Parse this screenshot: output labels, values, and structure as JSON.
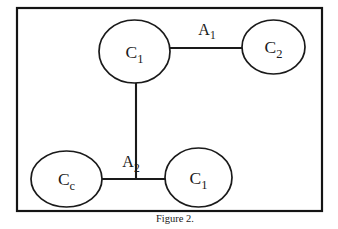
{
  "figure": {
    "caption": "Figure 2.",
    "frame": {
      "x": 17,
      "y": 8,
      "width": 305,
      "height": 203,
      "stroke_color": "#141414"
    },
    "background_color": "#ffffff",
    "ink_color": "#1a1a1a"
  },
  "diagram_data": {
    "type": "diagram",
    "title": "Figure 2.",
    "nodes": [
      {
        "id": "c1-top",
        "base": "C",
        "subscript": "1",
        "label": "C1",
        "cx": 134.5,
        "cy": 51.5,
        "rx": 35.5,
        "ry": 31.5
      },
      {
        "id": "c2-right",
        "base": "C",
        "subscript": "2",
        "label": "C2",
        "cx": 273.5,
        "cy": 47,
        "rx": 31.5,
        "ry": 27
      },
      {
        "id": "cc-bottomleft",
        "base": "C",
        "subscript": "c",
        "label": "Cc",
        "cx": 66.5,
        "cy": 179,
        "rx": 35.5,
        "ry": 28
      },
      {
        "id": "c1-bottom",
        "base": "C",
        "subscript": "1",
        "label": "C1",
        "cx": 198.5,
        "cy": 177.5,
        "rx": 33.5,
        "ry": 29.5
      }
    ],
    "edges": [
      {
        "id": "edge-a1",
        "from": "c1-top",
        "to": "c2-right",
        "orientation": "horizontal",
        "x1": 169,
        "y1": 48,
        "x2": 243,
        "y2": 48,
        "label_base": "A",
        "label_subscript": "1",
        "label": "A1",
        "label_x": 207,
        "label_y": 35
      },
      {
        "id": "edge-vertical",
        "from": "c1-top",
        "to": "junction",
        "orientation": "vertical",
        "x1": 136,
        "y1": 83,
        "x2": 136,
        "y2": 180,
        "label": ""
      },
      {
        "id": "edge-a2",
        "from": "cc-bottomleft",
        "to": "c1-bottom",
        "orientation": "horizontal",
        "x1": 102,
        "y1": 179,
        "x2": 166,
        "y2": 179,
        "label_base": "A",
        "label_subscript": "2",
        "label": "A2",
        "label_x": 133,
        "label_y": 167
      }
    ]
  }
}
